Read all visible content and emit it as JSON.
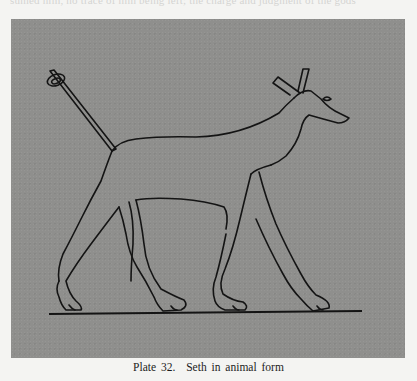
{
  "page": {
    "bleed_text_top": "sumed him, no trace of him being left; the charge and judgment of the gods",
    "plate": {
      "background_color": "#8f8f8d",
      "line_color": "#141414",
      "subject": "Seth in animal form",
      "illustration_icon": "seth-animal-drawing"
    },
    "caption": {
      "plate_label": "Plate 32.",
      "title": "Seth in animal form"
    }
  }
}
